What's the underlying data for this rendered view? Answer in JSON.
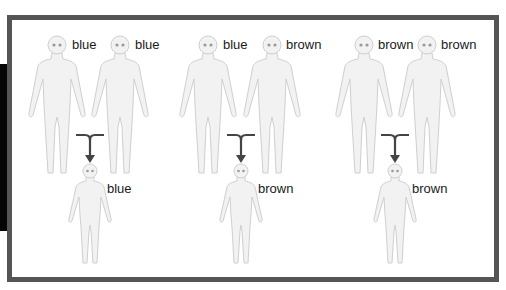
{
  "diagram": {
    "groups": [
      {
        "id": "group-1",
        "parents": [
          {
            "eye_color": "blue",
            "x": 57,
            "label_x": 72
          },
          {
            "eye_color": "blue",
            "x": 120,
            "label_x": 135
          }
        ],
        "connector_x": 90,
        "child": {
          "eye_color": "blue",
          "x": 90,
          "label_x": 107
        }
      },
      {
        "id": "group-2",
        "parents": [
          {
            "eye_color": "blue",
            "x": 208,
            "label_x": 223
          },
          {
            "eye_color": "brown",
            "x": 272,
            "label_x": 286
          }
        ],
        "connector_x": 241,
        "child": {
          "eye_color": "brown",
          "x": 241,
          "label_x": 258
        }
      },
      {
        "id": "group-3",
        "parents": [
          {
            "eye_color": "brown",
            "x": 364,
            "label_x": 378
          },
          {
            "eye_color": "brown",
            "x": 427,
            "label_x": 441
          }
        ],
        "connector_x": 395,
        "child": {
          "eye_color": "brown",
          "x": 395,
          "label_x": 412
        }
      }
    ],
    "colors": {
      "frame": "#555555",
      "figure_fill": "#f2f2f2",
      "figure_stroke": "#cfcfcf",
      "eyes": "#9a9a9a",
      "arrow": "#444444",
      "text": "#1a1a1a"
    }
  }
}
